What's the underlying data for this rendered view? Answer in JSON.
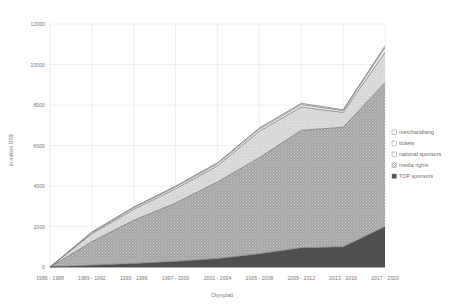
{
  "chart_data": {
    "type": "area",
    "stacked": true,
    "title": "",
    "xlabel": "Olympiad",
    "ylabel": "in million US$",
    "ylim": [
      0,
      12000
    ],
    "ytick_step": 2000,
    "yticks": [
      0,
      2000,
      4000,
      6000,
      8000,
      10000,
      12000
    ],
    "ytick_labels": [
      "0",
      "2000",
      "4000",
      "6000",
      "8000",
      "10000",
      "12000"
    ],
    "grid": true,
    "legend_position": "right",
    "categories": [
      "1985 - 1988",
      "1989 - 1992",
      "1993 - 1996",
      "1997 - 2000",
      "2001 - 2004",
      "2005 - 2008",
      "2009 - 2012",
      "2013 - 2016",
      "2017 - 2020"
    ],
    "series": [
      {
        "name": "TOP sponsors",
        "fill": "#4f4f4f",
        "pattern": "solid",
        "values": [
          0,
          95,
          175,
          280,
          415,
          660,
          950,
          1000,
          2000
        ]
      },
      {
        "name": "media rights",
        "fill": "#a8a8a8",
        "pattern": "dots",
        "values": [
          0,
          1155,
          2130,
          2880,
          3785,
          4740,
          5800,
          5900,
          7100
        ]
      },
      {
        "name": "national sponsors",
        "fill": "#d8d8d8",
        "pattern": "fine-dots",
        "values": [
          0,
          390,
          540,
          700,
          800,
          1300,
          1150,
          730,
          1500
        ]
      },
      {
        "name": "tickets",
        "fill": "#f2f2f2",
        "pattern": "light",
        "values": [
          0,
          60,
          80,
          90,
          100,
          110,
          120,
          90,
          230
        ]
      },
      {
        "name": "merchandising",
        "fill": "#fbfbfb",
        "pattern": "blank",
        "values": [
          0,
          30,
          40,
          45,
          50,
          55,
          60,
          50,
          85
        ]
      }
    ],
    "totals": [
      0,
      1730,
      2965,
      3995,
      5150,
      6865,
      8080,
      7770,
      10915
    ]
  },
  "legend": {
    "items": [
      {
        "label": "merchandising",
        "swatch": "#fbfbfb"
      },
      {
        "label": "tickets",
        "swatch": "#f2f2f2"
      },
      {
        "label": "national sponsors",
        "swatch": "#d8d8d8"
      },
      {
        "label": "media rights",
        "swatch": "#a8a8a8"
      },
      {
        "label": "TOP sponsors",
        "swatch": "#4f4f4f"
      }
    ]
  }
}
